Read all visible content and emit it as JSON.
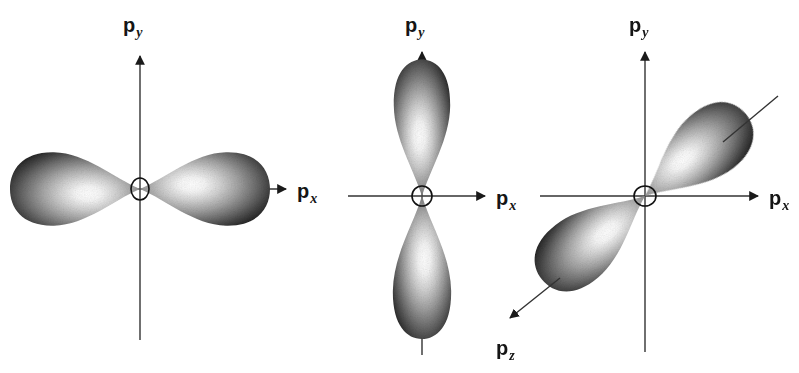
{
  "figure": {
    "background_color": "#ffffff",
    "ink_color": "#1a1a1a",
    "lobe_dark": "#2a2a2a",
    "lobe_mid": "#8a8a8a",
    "lobe_light": "#fbfbfb"
  },
  "panels": [
    {
      "id": "panel-px",
      "orbital": "p_x",
      "orientation": "horizontal",
      "origin": {
        "x": 140,
        "y": 189
      },
      "axes": [
        {
          "name": "y-axis",
          "label": "p",
          "subscript": "y",
          "label_pos": {
            "x": 123,
            "y": 26
          },
          "from": {
            "x": 140,
            "y": 340
          },
          "to": {
            "x": 140,
            "y": 52
          },
          "arrow": "up"
        },
        {
          "name": "x-axis",
          "label": "p",
          "subscript": "x",
          "label_pos": {
            "x": 300,
            "y": 198
          },
          "from": {
            "x": 10,
            "y": 189
          },
          "to": {
            "x": 288,
            "y": 189
          },
          "arrow": "right"
        }
      ],
      "lobes": [
        {
          "name": "lobe-negative-x",
          "direction": "left",
          "angle_deg": 180,
          "length": 128,
          "width": 96
        },
        {
          "name": "lobe-positive-x",
          "direction": "right",
          "angle_deg": 0,
          "length": 128,
          "width": 96
        }
      ],
      "nucleus": {
        "name": "nucleus-circle",
        "rx": 9,
        "ry": 11
      }
    },
    {
      "id": "panel-py",
      "orbital": "p_y",
      "orientation": "vertical",
      "origin": {
        "x": 422,
        "y": 196
      },
      "axes": [
        {
          "name": "y-axis",
          "label": "p",
          "subscript": "y",
          "label_pos": {
            "x": 405,
            "y": 26
          },
          "from": {
            "x": 422,
            "y": 355
          },
          "to": {
            "x": 422,
            "y": 48
          },
          "arrow": "up"
        },
        {
          "name": "x-axis",
          "label": "p",
          "subscript": "x",
          "label_pos": {
            "x": 497,
            "y": 205
          },
          "from": {
            "x": 348,
            "y": 196
          },
          "to": {
            "x": 487,
            "y": 196
          },
          "arrow": "right"
        }
      ],
      "lobes": [
        {
          "name": "lobe-positive-y",
          "direction": "up",
          "angle_deg": -90,
          "length": 120,
          "width": 78
        },
        {
          "name": "lobe-negative-y",
          "direction": "down",
          "angle_deg": 90,
          "length": 125,
          "width": 80
        }
      ],
      "nucleus": {
        "name": "nucleus-circle",
        "rx": 10,
        "ry": 10
      }
    },
    {
      "id": "panel-pz",
      "orbital": "p_z",
      "orientation": "diagonal",
      "origin": {
        "x": 645,
        "y": 196
      },
      "axes": [
        {
          "name": "y-axis",
          "label": "p",
          "subscript": "y",
          "label_pos": {
            "x": 629,
            "y": 26
          },
          "from": {
            "x": 645,
            "y": 352
          },
          "to": {
            "x": 645,
            "y": 48
          },
          "arrow": "up"
        },
        {
          "name": "x-axis",
          "label": "p",
          "subscript": "x",
          "label_pos": {
            "x": 770,
            "y": 205
          },
          "from": {
            "x": 540,
            "y": 196
          },
          "to": {
            "x": 760,
            "y": 196
          },
          "arrow": "right"
        },
        {
          "name": "z-axis",
          "label": "p",
          "subscript": "z",
          "label_pos": {
            "x": 498,
            "y": 348
          },
          "from": {
            "x": 778,
            "y": 96
          },
          "to": {
            "x": 508,
            "y": 319
          },
          "arrow": "down-left"
        }
      ],
      "lobes": [
        {
          "name": "lobe-positive-z",
          "direction": "up-right",
          "angle_deg": -39,
          "length": 120,
          "width": 80
        },
        {
          "name": "lobe-negative-z",
          "direction": "down-left",
          "angle_deg": 141,
          "length": 122,
          "width": 80
        }
      ],
      "nucleus": {
        "name": "nucleus-circle",
        "rx": 11,
        "ry": 10
      }
    }
  ]
}
